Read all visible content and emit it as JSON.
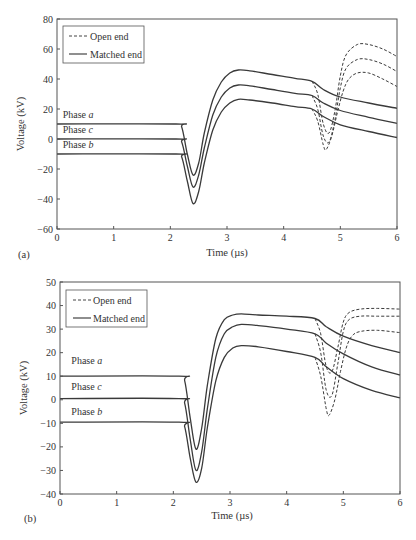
{
  "chart_data": [
    {
      "id": "a",
      "type": "line",
      "panel_label": "(a)",
      "xlabel": "Time (µs)",
      "ylabel": "Voltage (kV)",
      "xlim": [
        0,
        6
      ],
      "ylim": [
        -60,
        80
      ],
      "xticks": [
        0,
        1,
        2,
        3,
        4,
        5,
        6
      ],
      "yticks": [
        -60,
        -40,
        -20,
        0,
        20,
        40,
        60,
        80
      ],
      "grid": false,
      "legend": {
        "position": "upper-left",
        "entries": [
          {
            "label": "Open end",
            "style": "dashed"
          },
          {
            "label": "Matched end",
            "style": "solid"
          }
        ]
      },
      "annotations": [
        {
          "text": "Phase a",
          "x": 0.1,
          "y": 14
        },
        {
          "text": "Phase c",
          "x": 0.1,
          "y": 4
        },
        {
          "text": "Phase b",
          "x": 0.1,
          "y": -6
        }
      ],
      "series": [
        {
          "name": "Phase a (matched end)",
          "style": "solid",
          "x": [
            0,
            2.1,
            2.2,
            2.3,
            2.4,
            2.5,
            2.6,
            2.75,
            2.9,
            3.05,
            3.2,
            3.4,
            3.8,
            4.2,
            4.5,
            4.7,
            5.0,
            5.5,
            6.0
          ],
          "y": [
            10,
            10,
            8,
            -10,
            -24,
            -16,
            4,
            26,
            38,
            44,
            46,
            45.5,
            43,
            40.5,
            38.5,
            33,
            28,
            24,
            20.5
          ]
        },
        {
          "name": "Phase c (matched end)",
          "style": "solid",
          "x": [
            0,
            2.1,
            2.2,
            2.3,
            2.4,
            2.5,
            2.6,
            2.75,
            2.9,
            3.05,
            3.2,
            3.4,
            3.8,
            4.2,
            4.5,
            4.7,
            5.0,
            5.5,
            6.0
          ],
          "y": [
            0,
            0,
            -2,
            -18,
            -32,
            -24,
            -6,
            16,
            28,
            34,
            36,
            35.5,
            33,
            30.5,
            29,
            24,
            19,
            14.5,
            10.5
          ]
        },
        {
          "name": "Phase b (matched end)",
          "style": "solid",
          "x": [
            0,
            2.1,
            2.2,
            2.3,
            2.4,
            2.5,
            2.6,
            2.75,
            2.9,
            3.05,
            3.2,
            3.4,
            3.8,
            4.2,
            4.5,
            4.7,
            5.0,
            5.5,
            6.0
          ],
          "y": [
            -10,
            -10,
            -12,
            -28,
            -43,
            -35,
            -16,
            6,
            18,
            24,
            26.5,
            26,
            24,
            21.5,
            20,
            15,
            9.5,
            5,
            1
          ]
        },
        {
          "name": "Phase a (open end)",
          "style": "dashed",
          "x": [
            4.5,
            4.6,
            4.7,
            4.8,
            4.9,
            5.0,
            5.1,
            5.3,
            5.5,
            5.75,
            6.0
          ],
          "y": [
            38.5,
            30,
            10,
            4,
            18,
            42,
            56,
            63,
            63,
            60,
            55
          ]
        },
        {
          "name": "Phase c (open end)",
          "style": "dashed",
          "x": [
            4.5,
            4.6,
            4.7,
            4.8,
            4.9,
            5.0,
            5.1,
            5.3,
            5.5,
            5.75,
            6.0
          ],
          "y": [
            29,
            20,
            2,
            -2,
            12,
            34,
            47,
            53,
            53,
            50,
            45
          ]
        },
        {
          "name": "Phase b (open end)",
          "style": "dashed",
          "x": [
            4.5,
            4.6,
            4.7,
            4.75,
            4.85,
            4.95,
            5.05,
            5.15,
            5.3,
            5.5,
            5.75,
            6.0
          ],
          "y": [
            20,
            12,
            -4,
            -7,
            2,
            18,
            32,
            40,
            44,
            44,
            40,
            35
          ]
        }
      ]
    },
    {
      "id": "b",
      "type": "line",
      "panel_label": "(b)",
      "xlabel": "Time (µs)",
      "ylabel": "Voltage (kV)",
      "xlim": [
        0,
        6
      ],
      "ylim": [
        -40,
        50
      ],
      "xticks": [
        0,
        1,
        2,
        3,
        4,
        5,
        6
      ],
      "yticks": [
        -40,
        -30,
        -20,
        -10,
        0,
        10,
        20,
        30,
        40,
        50
      ],
      "grid": false,
      "legend": {
        "position": "upper-left",
        "entries": [
          {
            "label": "Open end",
            "style": "dashed"
          },
          {
            "label": "Matched end",
            "style": "solid"
          }
        ]
      },
      "annotations": [
        {
          "text": "Phase a",
          "x": 0.2,
          "y": 15
        },
        {
          "text": "Phase c",
          "x": 0.2,
          "y": 4
        },
        {
          "text": "Phase b",
          "x": 0.2,
          "y": -6.5
        }
      ],
      "series": [
        {
          "name": "Phase a (matched end)",
          "style": "solid",
          "x": [
            0,
            2.1,
            2.2,
            2.3,
            2.4,
            2.5,
            2.6,
            2.75,
            2.9,
            3.05,
            3.2,
            3.5,
            4.0,
            4.5,
            4.7,
            5.0,
            5.5,
            6.0
          ],
          "y": [
            10,
            10,
            8,
            -8,
            -21,
            -12,
            6,
            26,
            34,
            36,
            36.5,
            36,
            35.5,
            34.5,
            31,
            27,
            23,
            20
          ]
        },
        {
          "name": "Phase c (matched end)",
          "style": "solid",
          "x": [
            0,
            2.1,
            2.2,
            2.3,
            2.4,
            2.5,
            2.6,
            2.75,
            2.9,
            3.05,
            3.2,
            3.5,
            4.0,
            4.5,
            4.7,
            5.0,
            5.5,
            6.0
          ],
          "y": [
            0.5,
            0.5,
            -1.5,
            -17,
            -30,
            -22,
            -4,
            18,
            28,
            31,
            32,
            31.5,
            30,
            28,
            24,
            19.5,
            14,
            10.5
          ]
        },
        {
          "name": "Phase b (matched end)",
          "style": "solid",
          "x": [
            0,
            2.1,
            2.2,
            2.3,
            2.4,
            2.5,
            2.6,
            2.75,
            2.9,
            3.05,
            3.2,
            3.5,
            4.0,
            4.5,
            4.7,
            5.0,
            5.5,
            6.0
          ],
          "y": [
            -9.5,
            -9.5,
            -11.5,
            -25,
            -35,
            -29,
            -12,
            8,
            18,
            22,
            23,
            22.5,
            20.5,
            18,
            14,
            9,
            4,
            0.8
          ]
        },
        {
          "name": "Phase a (open end)",
          "style": "dashed",
          "x": [
            4.5,
            4.6,
            4.7,
            4.8,
            4.9,
            5.0,
            5.1,
            5.3,
            5.6,
            6.0
          ],
          "y": [
            34.5,
            28,
            14,
            12,
            22,
            33,
            37,
            38.5,
            38.8,
            38.5
          ]
        },
        {
          "name": "Phase c (open end)",
          "style": "dashed",
          "x": [
            4.5,
            4.6,
            4.7,
            4.8,
            4.9,
            5.0,
            5.1,
            5.3,
            5.6,
            6.0
          ],
          "y": [
            28,
            20,
            4,
            2,
            15,
            29,
            34,
            35.5,
            35.5,
            35.5
          ]
        },
        {
          "name": "Phase b (open end)",
          "style": "dashed",
          "x": [
            4.5,
            4.6,
            4.7,
            4.75,
            4.85,
            4.95,
            5.05,
            5.15,
            5.3,
            5.6,
            6.0
          ],
          "y": [
            18,
            10,
            -4,
            -6.5,
            0,
            12,
            22,
            27,
            29,
            29.5,
            28.5
          ]
        }
      ]
    }
  ]
}
